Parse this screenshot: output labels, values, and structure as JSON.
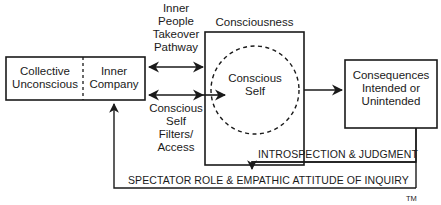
{
  "diagram": {
    "nodes": {
      "collective_unconscious": {
        "label": "Collective\nUnconscious"
      },
      "inner_company": {
        "label": "Inner\nCompany"
      },
      "consciousness": {
        "label": "Consciousness"
      },
      "conscious_self": {
        "label": "Conscious\nSelf"
      },
      "consequences": {
        "label": "Consequences\nIntended or\nUnintended"
      }
    },
    "edges": {
      "takeover": {
        "label": "Inner\nPeople\nTakeover\nPathway",
        "from": "inner_company",
        "to": "consciousness",
        "bidirectional": true
      },
      "filters": {
        "label": "Conscious\nSelf\nFilters/\nAccess",
        "from": "inner_company",
        "to": "conscious_self",
        "bidirectional": true
      },
      "output": {
        "label": "",
        "from": "consciousness",
        "to": "consequences"
      },
      "introspection": {
        "label": "INTROSPECTION  &  JUDGMENT",
        "from": "consequences",
        "to": "consciousness"
      },
      "spectator": {
        "label": "SPECTATOR ROLE  &  EMPATHIC ATTITUDE OF INQUIRY",
        "from": "consequences",
        "to": "inner_company"
      }
    },
    "trademark": "TM",
    "colors": {
      "stroke": "#1a1a1a",
      "background": "#ffffff"
    }
  }
}
